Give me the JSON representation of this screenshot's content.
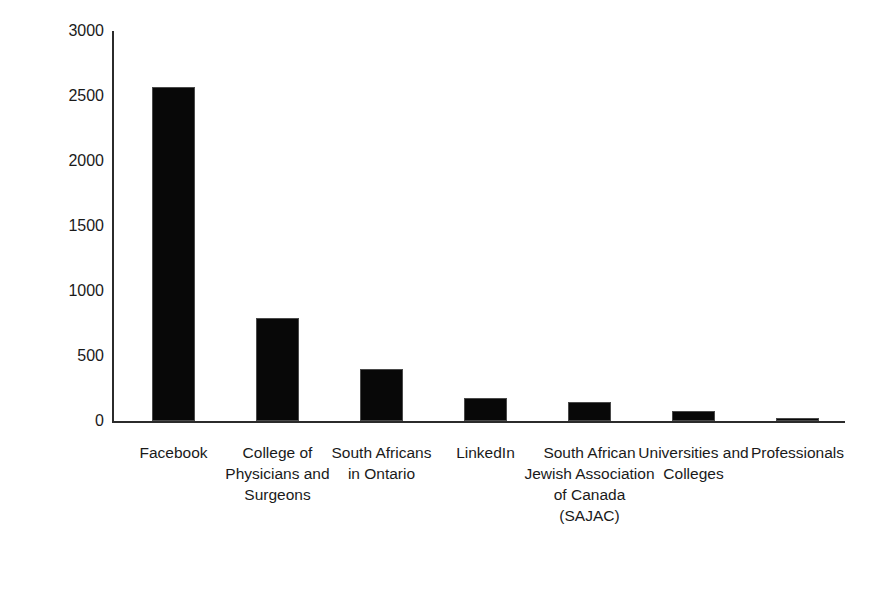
{
  "chart_data": {
    "type": "bar",
    "title": "",
    "xlabel": "",
    "ylabel": "Number of individuals contacted",
    "ylim": [
      0,
      3000
    ],
    "yticks": [
      0,
      500,
      1000,
      1500,
      2000,
      2500,
      3000
    ],
    "ytick_labels": [
      "0",
      "500",
      "1000",
      "1500",
      "2000",
      "2500",
      "3000"
    ],
    "grid": false,
    "legend": false,
    "bar_color": "#080808",
    "axis_color": "#2b2b2b",
    "background": "#ffffff",
    "categories": [
      "Facebook",
      "College of Physicians and Surgeons",
      "South Africans in Ontario",
      "LinkedIn",
      "South African Jewish Association of Canada (SAJAC)",
      "Universities and Colleges",
      "Professionals"
    ],
    "values": [
      2570,
      790,
      400,
      180,
      145,
      75,
      25
    ]
  }
}
